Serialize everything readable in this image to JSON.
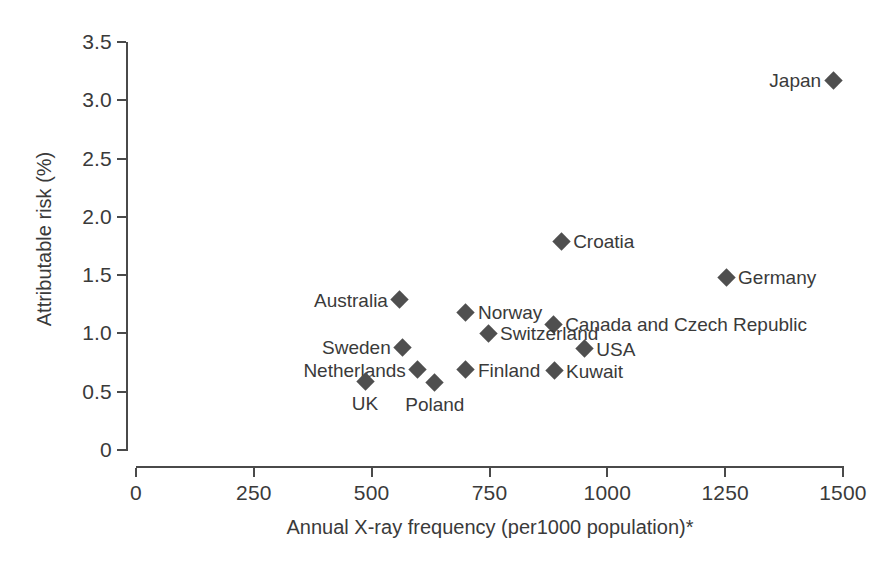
{
  "chart_data": {
    "type": "scatter",
    "title": "",
    "xlabel": "Annual X-ray frequency (per1000 population)*",
    "ylabel": "Attributable risk (%)",
    "xlim": [
      0,
      1500
    ],
    "ylim": [
      0,
      3.5
    ],
    "xticks": [
      "0",
      "250",
      "500",
      "750",
      "1000",
      "1250",
      "1500"
    ],
    "xtick_values": [
      0,
      250,
      500,
      750,
      1000,
      1250,
      1500
    ],
    "yticks": [
      "0",
      "0.5",
      "1.0",
      "1.5",
      "2.0",
      "2.5",
      "3.0",
      "3.5"
    ],
    "ytick_values": [
      0,
      0.5,
      1.0,
      1.5,
      2.0,
      2.5,
      3.0,
      3.5
    ],
    "grid": false,
    "legend": "none",
    "marker": "diamond",
    "marker_color": "#4f4f4f",
    "points": [
      {
        "label": "Japan",
        "x": 1479,
        "y": 3.17,
        "label_pos": "left"
      },
      {
        "label": "Croatia",
        "x": 902,
        "y": 1.79,
        "label_pos": "right"
      },
      {
        "label": "Germany",
        "x": 1252,
        "y": 1.48,
        "label_pos": "right"
      },
      {
        "label": "Australia",
        "x": 560,
        "y": 1.29,
        "label_pos": "left"
      },
      {
        "label": "Norway",
        "x": 700,
        "y": 1.18,
        "label_pos": "right"
      },
      {
        "label": "Canada and Czech Republic",
        "x": 885,
        "y": 1.08,
        "label_pos": "right"
      },
      {
        "label": "Switzerland",
        "x": 747,
        "y": 1.0,
        "label_pos": "right"
      },
      {
        "label": "Sweden",
        "x": 566,
        "y": 0.88,
        "label_pos": "left"
      },
      {
        "label": "USA",
        "x": 951,
        "y": 0.87,
        "label_pos": "right"
      },
      {
        "label": "Finland",
        "x": 700,
        "y": 0.69,
        "label_pos": "right"
      },
      {
        "label": "Kuwait",
        "x": 887,
        "y": 0.68,
        "label_pos": "right"
      },
      {
        "label": "Netherlands",
        "x": 598,
        "y": 0.69,
        "label_pos": "left"
      },
      {
        "label": "UK",
        "x": 486,
        "y": 0.59,
        "label_pos": "below"
      },
      {
        "label": "Poland",
        "x": 634,
        "y": 0.58,
        "label_pos": "below"
      }
    ]
  }
}
